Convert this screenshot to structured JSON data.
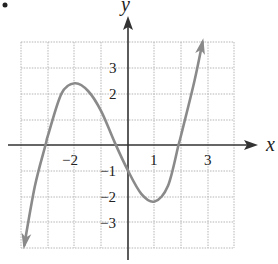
{
  "figure": {
    "bullet": "•",
    "x_axis_label": "x",
    "y_axis_label": "y",
    "x_tick_labels": [
      "−2",
      "1",
      "3"
    ],
    "y_tick_labels": [
      "3",
      "2",
      "−1",
      "−2",
      "−3"
    ]
  },
  "colors": {
    "curve": "#8a8a8a",
    "axis": "#333333",
    "grid": "#b5b5b5"
  },
  "chart_data": {
    "type": "line",
    "title": "",
    "xlabel": "x",
    "ylabel": "y",
    "xlim": [
      -4,
      4
    ],
    "ylim": [
      -4,
      4
    ],
    "grid": true,
    "x_ticks_labeled": [
      -2,
      1,
      3
    ],
    "y_ticks_labeled": [
      3,
      2,
      -1,
      -2,
      -3
    ],
    "series": [
      {
        "name": "cubic curve",
        "description": "Cubic polynomial with local maximum near (-2, 2.4), local minimum near (1, -2.2), y-intercept -1, x-intercepts near -3.1, -0.6, 1.9; arrows at both ends",
        "x": [
          -3.9,
          -3.5,
          -3.1,
          -3.0,
          -2.5,
          -2.0,
          -1.5,
          -1.0,
          -0.5,
          0.0,
          0.5,
          1.0,
          1.5,
          1.9,
          2.0,
          2.5,
          2.8
        ],
        "y": [
          -3.9,
          -1.6,
          0.0,
          0.4,
          2.0,
          2.4,
          2.1,
          1.3,
          0.1,
          -1.0,
          -1.9,
          -2.2,
          -1.6,
          0.0,
          0.4,
          2.5,
          4.0
        ]
      }
    ],
    "key_points": {
      "local_max": [
        -2,
        2.4
      ],
      "local_min": [
        1,
        -2.2
      ],
      "y_intercept": [
        0,
        -1
      ]
    }
  }
}
